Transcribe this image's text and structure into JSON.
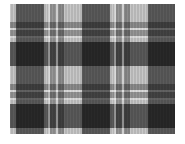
{
  "image": {
    "subject": "grayscale tartan plaid fabric pattern",
    "colors": {
      "background": "#ffffff",
      "light": "#b5b5b5",
      "dark": "#1a1a1a",
      "highlight": "#e0e0e0"
    }
  }
}
